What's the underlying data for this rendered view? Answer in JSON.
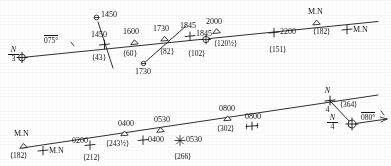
{
  "figure": {
    "kind": "survey-track-chart",
    "line_color": "#1a1a1a",
    "background": "#ffffff"
  },
  "top_track": {
    "name": "upper-track-line",
    "start_station": {
      "top": "N",
      "bottom": "3",
      "marker": "circled-cross"
    },
    "bearing": {
      "value": "075°",
      "name": "bearing-075"
    },
    "fixes": [
      {
        "time": "1450",
        "marker": "cross",
        "distance": "⟨43⟩"
      },
      {
        "time": "1600",
        "marker": "triangle",
        "distance": "⟨60⟩"
      },
      {
        "time": "1730",
        "marker": "triangle",
        "distance": "⟨82⟩"
      },
      {
        "time": "1845",
        "marker": "cross",
        "distance": ""
      },
      {
        "time": "1845",
        "marker": "circled-cross",
        "distance": "⟨102⟩"
      },
      {
        "time": "2000",
        "marker": "triangle",
        "distance": "⟨120½⟩"
      },
      {
        "time": "2200",
        "marker": "cross",
        "distance": "⟨151⟩"
      },
      {
        "time": "M.N",
        "marker": "triangle",
        "distance": "⟨182⟩"
      },
      {
        "time": "M.N",
        "marker": "cross",
        "distance": ""
      }
    ],
    "offline_fixes": [
      {
        "time": "1450",
        "marker": "small-circle",
        "note": "crossing-leg-upper"
      },
      {
        "time": "1730",
        "marker": "small-circle",
        "note": "crossing-leg-lower"
      }
    ]
  },
  "bottom_track": {
    "name": "lower-track-line",
    "fixes": [
      {
        "time": "M.N",
        "marker": "triangle",
        "distance": "⟨182⟩"
      },
      {
        "time": "M.N",
        "marker": "cross",
        "distance": ""
      },
      {
        "time": "0200",
        "marker": "cross",
        "distance": "⟨212⟩"
      },
      {
        "time": "0400",
        "marker": "triangle",
        "distance": "⟨243½⟩"
      },
      {
        "time": "0400",
        "marker": "cross",
        "distance": ""
      },
      {
        "time": "0530",
        "marker": "triangle",
        "distance": ""
      },
      {
        "time": "0530",
        "marker": "star",
        "distance": "⟨266⟩"
      },
      {
        "time": "0800",
        "marker": "triangle",
        "distance": "⟨302⟩"
      },
      {
        "time": "0800",
        "marker": "cross",
        "distance": ""
      }
    ],
    "end_station": {
      "top": "N",
      "bottom": "4",
      "marker": "cross"
    },
    "end_distance": "⟨364⟩",
    "arrival_station": {
      "top": "N",
      "bottom": "4",
      "marker": "circled-cross"
    },
    "bearing": {
      "value": "080°",
      "name": "bearing-080"
    }
  }
}
